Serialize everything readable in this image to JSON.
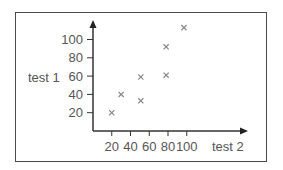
{
  "chart_data": {
    "type": "scatter",
    "title": "",
    "xlabel": "test 2",
    "ylabel": "test 1",
    "xticks": [
      20,
      40,
      60,
      80,
      100
    ],
    "yticks": [
      20,
      40,
      60,
      80,
      100
    ],
    "xlim": [
      0,
      125
    ],
    "ylim": [
      0,
      120
    ],
    "grid": false,
    "legend": null,
    "marker": "x",
    "points": [
      {
        "x": 20,
        "y": 20
      },
      {
        "x": 30,
        "y": 40
      },
      {
        "x": 51,
        "y": 33
      },
      {
        "x": 51,
        "y": 59
      },
      {
        "x": 78,
        "y": 61
      },
      {
        "x": 78,
        "y": 92
      },
      {
        "x": 97,
        "y": 113
      }
    ]
  },
  "colors": {
    "axis": "#333333",
    "marker": "#888888",
    "text": "#555555",
    "frame": "#4a4a4a"
  }
}
